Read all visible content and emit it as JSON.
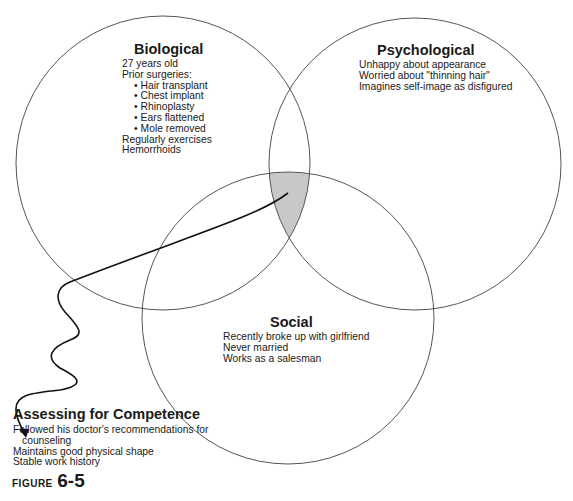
{
  "diagram": {
    "type": "venn",
    "circles": [
      {
        "id": "biological",
        "title": "Biological",
        "cx": 163,
        "cy": 163,
        "r": 147,
        "items": [
          {
            "text": "27 years old",
            "style": "plain"
          },
          {
            "text": "Prior surgeries:",
            "style": "plain"
          },
          {
            "text": "Hair transplant",
            "style": "bullet"
          },
          {
            "text": "Chest implant",
            "style": "bullet"
          },
          {
            "text": "Rhinoplasty",
            "style": "bullet"
          },
          {
            "text": "Ears flattened",
            "style": "bullet"
          },
          {
            "text": "Mole removed",
            "style": "bullet"
          },
          {
            "text": "Regularly exercises",
            "style": "plain"
          },
          {
            "text": "Hemorrhoids",
            "style": "plain"
          }
        ]
      },
      {
        "id": "psychological",
        "title": "Psychological",
        "cx": 415,
        "cy": 164,
        "r": 146,
        "items": [
          {
            "text": "Unhappy about appearance",
            "style": "plain"
          },
          {
            "text": "Worried about \"thinning hair\"",
            "style": "plain"
          },
          {
            "text": "Imagines self-image as disfigured",
            "style": "plain"
          }
        ]
      },
      {
        "id": "social",
        "title": "Social",
        "cx": 288,
        "cy": 318,
        "r": 146,
        "items": [
          {
            "text": "Recently broke up with girlfriend",
            "style": "plain"
          },
          {
            "text": "Never married",
            "style": "plain"
          },
          {
            "text": "Works as a salesman",
            "style": "plain"
          }
        ]
      }
    ],
    "intersection_fill": "#c8c8c8",
    "stroke_color": "#555555",
    "arrow_color": "#111111"
  },
  "callout": {
    "title": "Assessing for Competence",
    "items": [
      {
        "text": "Followed his doctor's recommendations for",
        "style": "plain"
      },
      {
        "text": "counseling",
        "style": "indent"
      },
      {
        "text": "Maintains good physical shape",
        "style": "plain"
      },
      {
        "text": "Stable work history",
        "style": "plain"
      }
    ]
  },
  "figure": {
    "label_word": "FIGURE",
    "label_number": "6-5"
  }
}
